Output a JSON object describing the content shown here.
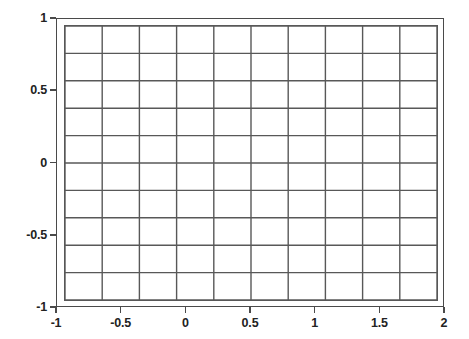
{
  "figure": {
    "name": "empty-grid-plot",
    "background_color": "#ffffff",
    "frame_color": "#4a4a4a",
    "grid_color": "#585858",
    "text_color": "#222222"
  },
  "chart_data": {
    "type": "line",
    "title": "",
    "subtitle": "",
    "xlabel": "",
    "ylabel": "",
    "xlim": [
      -1,
      2
    ],
    "ylim": [
      -1,
      1
    ],
    "grid": true,
    "legend": null,
    "legend_position": "none",
    "series": [],
    "annotations": [],
    "x_ticks": [
      -1,
      -0.5,
      0,
      0.5,
      1,
      1.5,
      2
    ],
    "x_tick_labels": [
      "-1",
      "-0.5",
      "0",
      "0.5",
      "1",
      "1.5",
      "2"
    ],
    "y_ticks": [
      1,
      0.5,
      0,
      -0.5,
      -1
    ],
    "y_tick_labels": [
      "1",
      "0.5",
      "0",
      "-0.5",
      "-1"
    ],
    "grid_columns": 10,
    "grid_rows": 10,
    "grid_x_lines": [
      -1,
      -0.7,
      -0.4,
      -0.1,
      0.2,
      0.5,
      0.8,
      1.1,
      1.4,
      1.7,
      2
    ],
    "grid_y_lines": [
      -1,
      -0.8,
      -0.6,
      -0.4,
      -0.2,
      0,
      0.2,
      0.4,
      0.6,
      0.8,
      1
    ]
  }
}
